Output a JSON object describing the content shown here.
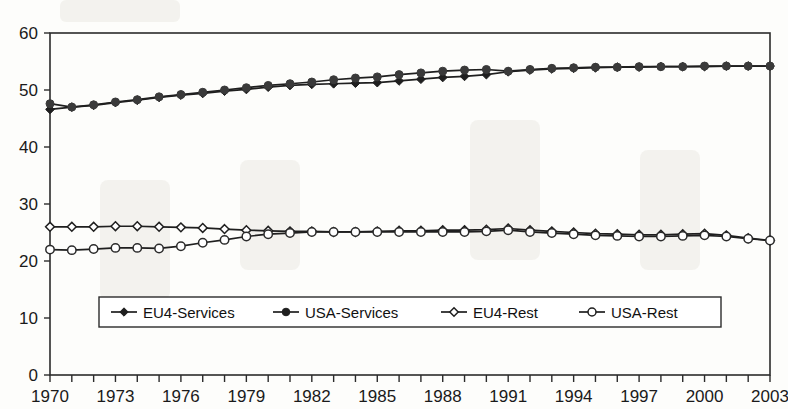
{
  "chart_data": {
    "type": "line",
    "title": "",
    "xlabel": "",
    "ylabel": "",
    "xlim": [
      1970,
      2003
    ],
    "ylim": [
      0,
      60
    ],
    "ytick_values": [
      0,
      10,
      20,
      30,
      40,
      50,
      60
    ],
    "ytick_labels": [
      "0",
      "10",
      "20",
      "30",
      "40",
      "50",
      "60"
    ],
    "xtick_labels": [
      "1970",
      "1973",
      "1976",
      "1979",
      "1982",
      "1985",
      "1988",
      "1991",
      "1994",
      "1997",
      "2000",
      "2003"
    ],
    "xtick_label_values": [
      1970,
      1973,
      1976,
      1979,
      1982,
      1985,
      1988,
      1991,
      1994,
      1997,
      2000,
      2003
    ],
    "xtick_minor_values": [
      1970,
      1971,
      1972,
      1973,
      1974,
      1975,
      1976,
      1977,
      1978,
      1979,
      1980,
      1981,
      1982,
      1983,
      1984,
      1985,
      1986,
      1987,
      1988,
      1989,
      1990,
      1991,
      1992,
      1993,
      1994,
      1995,
      1996,
      1997,
      1998,
      1999,
      2000,
      2001,
      2002,
      2003
    ],
    "grid": false,
    "legend_position": "inside-bottom-center",
    "x": [
      1970,
      1971,
      1972,
      1973,
      1974,
      1975,
      1976,
      1977,
      1978,
      1979,
      1980,
      1981,
      1982,
      1983,
      1984,
      1985,
      1986,
      1987,
      1988,
      1989,
      1990,
      1991,
      1992,
      1993,
      1994,
      1995,
      1996,
      1997,
      1998,
      1999,
      2000,
      2001,
      2002,
      2003
    ],
    "series": [
      {
        "name": "EU4-Services",
        "marker": "filled-diamond",
        "color": "#1f1f1f",
        "values": [
          46.6,
          47.0,
          47.3,
          47.8,
          48.2,
          48.7,
          49.1,
          49.4,
          49.8,
          50.1,
          50.5,
          50.8,
          51.0,
          51.1,
          51.2,
          51.3,
          51.6,
          51.9,
          52.2,
          52.4,
          52.7,
          53.2,
          53.5,
          53.7,
          53.8,
          53.9,
          54.0,
          54.0,
          54.1,
          54.1,
          54.1,
          54.2,
          54.2,
          54.2
        ]
      },
      {
        "name": "USA-Services",
        "marker": "filled-circle",
        "color": "#3a3a3a",
        "values": [
          47.6,
          47.0,
          47.4,
          47.9,
          48.3,
          48.8,
          49.2,
          49.6,
          50.0,
          50.4,
          50.8,
          51.1,
          51.4,
          51.8,
          52.1,
          52.3,
          52.7,
          53.0,
          53.3,
          53.5,
          53.6,
          53.3,
          53.6,
          53.8,
          53.9,
          54.0,
          54.0,
          54.1,
          54.1,
          54.1,
          54.2,
          54.2,
          54.2,
          54.2
        ]
      },
      {
        "name": "EU4-Rest",
        "marker": "open-diamond",
        "color": "#1f1f1f",
        "values": [
          26.0,
          26.0,
          26.0,
          26.1,
          26.1,
          26.0,
          25.9,
          25.8,
          25.6,
          25.4,
          25.3,
          25.2,
          25.2,
          25.1,
          25.1,
          25.2,
          25.3,
          25.3,
          25.4,
          25.4,
          25.5,
          25.7,
          25.4,
          25.2,
          25.0,
          24.8,
          24.7,
          24.6,
          24.6,
          24.7,
          24.8,
          24.5,
          24.0,
          23.6
        ]
      },
      {
        "name": "USA-Rest",
        "marker": "open-circle",
        "color": "#2b2b2b",
        "values": [
          22.0,
          21.9,
          22.1,
          22.3,
          22.3,
          22.2,
          22.6,
          23.2,
          23.7,
          24.3,
          24.7,
          24.9,
          25.1,
          25.1,
          25.1,
          25.1,
          25.1,
          25.1,
          25.1,
          25.1,
          25.2,
          25.4,
          25.1,
          24.9,
          24.7,
          24.5,
          24.4,
          24.3,
          24.3,
          24.4,
          24.5,
          24.3,
          23.9,
          23.6
        ]
      }
    ]
  },
  "legend": {
    "items": [
      {
        "label": "EU4-Services",
        "marker": "filled-diamond"
      },
      {
        "label": "USA-Services",
        "marker": "filled-circle"
      },
      {
        "label": "EU4-Rest",
        "marker": "open-diamond"
      },
      {
        "label": "USA-Rest",
        "marker": "open-circle"
      }
    ]
  }
}
